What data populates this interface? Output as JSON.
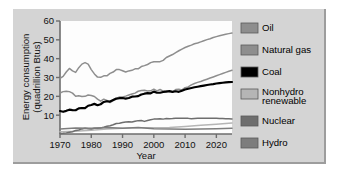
{
  "figure": {
    "background_color": "#d4d4d4",
    "plot_background_color": "#fdfdfd"
  },
  "chart_data": {
    "type": "line",
    "title": "",
    "xlabel": "Year",
    "ylabel": "Energy consumption (quadrillion Btus)",
    "ylabel_line1": "Energy consumption",
    "ylabel_line2": "(quadrillion Btus)",
    "xlim": [
      1970,
      2025
    ],
    "ylim": [
      0,
      60
    ],
    "xticks": [
      1970,
      1980,
      1990,
      2000,
      2010,
      2020
    ],
    "xtick_labels": [
      "1970",
      "1980",
      "1990",
      "2000",
      "2010",
      "2020"
    ],
    "yticks": [
      10,
      20,
      30,
      40,
      50,
      60
    ],
    "ytick_labels": [
      "10",
      "20",
      "30",
      "40",
      "50",
      "60"
    ],
    "grid": false,
    "legend_position": "right",
    "series": [
      {
        "name": "Oil",
        "color": "#8e8e8e",
        "x": [
          1970,
          1971,
          1972,
          1973,
          1974,
          1975,
          1976,
          1977,
          1978,
          1979,
          1980,
          1981,
          1982,
          1983,
          1984,
          1985,
          1986,
          1987,
          1988,
          1989,
          1990,
          1991,
          1992,
          1993,
          1994,
          1995,
          1996,
          1997,
          1998,
          1999,
          2000,
          2001,
          2002,
          2003,
          2004,
          2005,
          2006,
          2007,
          2008,
          2009,
          2010,
          2011,
          2012,
          2013,
          2014,
          2015,
          2016,
          2017,
          2018,
          2019,
          2020,
          2021,
          2022,
          2023,
          2024,
          2025
        ],
        "values": [
          29.5,
          30.6,
          32.9,
          34.8,
          33.5,
          32.7,
          35.2,
          37.1,
          37.9,
          37.1,
          34.2,
          31.9,
          30.2,
          30.1,
          30.9,
          30.9,
          32.2,
          32.9,
          34.2,
          34.2,
          33.6,
          32.9,
          33.5,
          33.8,
          34.6,
          34.6,
          35.8,
          36.3,
          36.9,
          37.9,
          38.4,
          38.3,
          38.4,
          39.1,
          40.6,
          41.4,
          42.2,
          43.2,
          44.2,
          45.1,
          45.9,
          46.6,
          47.2,
          47.9,
          48.3,
          48.9,
          49.5,
          50.1,
          50.6,
          51.2,
          51.7,
          52.2,
          52.6,
          53.0,
          53.3,
          53.6
        ]
      },
      {
        "name": "Natural gas",
        "color": "#8e8e8e",
        "x": [
          1970,
          1971,
          1972,
          1973,
          1974,
          1975,
          1976,
          1977,
          1978,
          1979,
          1980,
          1981,
          1982,
          1983,
          1984,
          1985,
          1986,
          1987,
          1988,
          1989,
          1990,
          1991,
          1992,
          1993,
          1994,
          1995,
          1996,
          1997,
          1998,
          1999,
          2000,
          2001,
          2002,
          2003,
          2004,
          2005,
          2006,
          2007,
          2008,
          2009,
          2010,
          2011,
          2012,
          2013,
          2014,
          2015,
          2016,
          2017,
          2018,
          2019,
          2020,
          2021,
          2022,
          2023,
          2024,
          2025
        ],
        "values": [
          21.8,
          22.5,
          22.7,
          22.5,
          21.7,
          20.0,
          20.3,
          19.9,
          20.0,
          20.7,
          20.4,
          19.9,
          18.5,
          17.4,
          18.5,
          17.8,
          16.7,
          17.7,
          18.6,
          19.7,
          19.6,
          20.1,
          20.7,
          21.2,
          21.7,
          22.7,
          23.1,
          23.2,
          22.8,
          22.9,
          23.8,
          22.9,
          23.6,
          22.8,
          22.9,
          22.6,
          22.2,
          23.6,
          23.8,
          23.4,
          24.6,
          25.0,
          26.1,
          26.8,
          27.4,
          27.9,
          28.5,
          29.1,
          29.7,
          30.3,
          30.9,
          31.5,
          32.1,
          32.7,
          33.3,
          33.8
        ]
      },
      {
        "name": "Coal",
        "color": "#000000",
        "x": [
          1970,
          1971,
          1972,
          1973,
          1974,
          1975,
          1976,
          1977,
          1978,
          1979,
          1980,
          1981,
          1982,
          1983,
          1984,
          1985,
          1986,
          1987,
          1988,
          1989,
          1990,
          1991,
          1992,
          1993,
          1994,
          1995,
          1996,
          1997,
          1998,
          1999,
          2000,
          2001,
          2002,
          2003,
          2004,
          2005,
          2006,
          2007,
          2008,
          2009,
          2010,
          2011,
          2012,
          2013,
          2014,
          2015,
          2016,
          2017,
          2018,
          2019,
          2020,
          2021,
          2022,
          2023,
          2024,
          2025
        ],
        "values": [
          12.2,
          11.8,
          12.3,
          12.9,
          12.7,
          12.6,
          13.6,
          13.8,
          13.7,
          15.0,
          15.4,
          16.0,
          15.3,
          15.8,
          17.0,
          17.4,
          17.2,
          18.0,
          18.8,
          19.0,
          19.1,
          18.8,
          19.1,
          19.8,
          19.9,
          20.1,
          21.0,
          21.4,
          21.7,
          21.6,
          22.5,
          21.9,
          21.9,
          22.3,
          22.5,
          22.8,
          22.4,
          22.7,
          22.4,
          23.0,
          23.6,
          24.0,
          24.4,
          24.8,
          25.1,
          25.4,
          25.7,
          26.0,
          26.3,
          26.5,
          26.8,
          27.0,
          27.2,
          27.4,
          27.5,
          27.6
        ]
      },
      {
        "name": "Nonhydro renewable",
        "color": "#b5b5b5",
        "x": [
          1970,
          1975,
          1980,
          1985,
          1990,
          1995,
          2000,
          2005,
          2010,
          2015,
          2020,
          2025
        ],
        "values": [
          1.2,
          1.5,
          2.0,
          2.6,
          3.1,
          3.3,
          3.3,
          3.5,
          4.0,
          4.6,
          5.2,
          5.8
        ]
      },
      {
        "name": "Nuclear",
        "color": "#6e6e6e",
        "x": [
          1970,
          1971,
          1972,
          1973,
          1974,
          1975,
          1976,
          1977,
          1978,
          1979,
          1980,
          1981,
          1982,
          1983,
          1984,
          1985,
          1986,
          1987,
          1988,
          1989,
          1990,
          1991,
          1992,
          1993,
          1994,
          1995,
          1996,
          1997,
          1998,
          1999,
          2000,
          2001,
          2002,
          2003,
          2004,
          2005,
          2006,
          2007,
          2008,
          2009,
          2010,
          2011,
          2012,
          2013,
          2014,
          2015,
          2016,
          2017,
          2018,
          2019,
          2020,
          2021,
          2022,
          2023,
          2024,
          2025
        ],
        "values": [
          0.3,
          0.4,
          0.6,
          0.9,
          1.2,
          1.9,
          2.1,
          2.7,
          3.0,
          2.8,
          2.7,
          3.0,
          3.1,
          3.2,
          3.6,
          4.1,
          4.4,
          4.9,
          5.6,
          5.7,
          6.1,
          6.4,
          6.5,
          6.4,
          6.8,
          7.1,
          7.2,
          6.7,
          7.2,
          7.6,
          7.9,
          8.0,
          8.1,
          7.9,
          8.2,
          8.1,
          8.2,
          8.4,
          8.4,
          8.4,
          8.4,
          8.3,
          8.1,
          8.2,
          8.3,
          8.4,
          8.4,
          8.3,
          8.3,
          8.3,
          8.3,
          8.2,
          8.2,
          8.1,
          8.1,
          8.0
        ]
      },
      {
        "name": "Hydro",
        "color": "#7d7d7d",
        "x": [
          1970,
          1975,
          1980,
          1985,
          1990,
          1995,
          2000,
          2005,
          2010,
          2015,
          2020,
          2025
        ],
        "values": [
          2.6,
          3.2,
          3.1,
          3.4,
          3.0,
          3.5,
          2.8,
          2.7,
          2.5,
          2.6,
          2.8,
          3.0
        ]
      }
    ]
  },
  "legend": {
    "items": [
      {
        "label": "Oil",
        "color": "#8e8e8e"
      },
      {
        "label": "Natural gas",
        "color": "#8e8e8e"
      },
      {
        "label": "Coal",
        "color": "#000000"
      },
      {
        "label": "Nonhydro",
        "label2": "renewable",
        "color": "#b5b5b5"
      },
      {
        "label": "Nuclear",
        "color": "#6e6e6e"
      },
      {
        "label": "Hydro",
        "color": "#7d7d7d"
      }
    ]
  }
}
